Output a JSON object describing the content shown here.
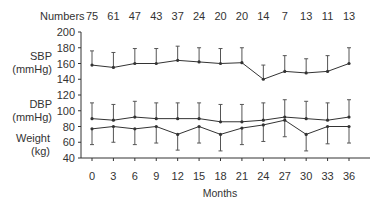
{
  "chart_data": {
    "type": "line",
    "title": "",
    "xlabel": "Months",
    "x": [
      0,
      3,
      6,
      9,
      12,
      15,
      18,
      21,
      24,
      27,
      30,
      33,
      36
    ],
    "numbers_label": "Numbers",
    "numbers": [
      75,
      61,
      47,
      43,
      37,
      24,
      20,
      20,
      14,
      7,
      13,
      11,
      13
    ],
    "ylim": [
      40,
      200
    ],
    "yticks": [
      40,
      60,
      80,
      100,
      120,
      140,
      160,
      180,
      200
    ],
    "grid": false,
    "legend": "none; series labelled on left side of y axis",
    "series": [
      {
        "name": "SBP (mmHg)",
        "label_lines": [
          "SBP",
          "(mmHg)"
        ],
        "values": [
          158,
          155,
          160,
          160,
          164,
          162,
          160,
          161,
          140,
          150,
          148,
          150,
          160
        ],
        "error_direction": "up",
        "error_ends": [
          176,
          174,
          179,
          179,
          182,
          180,
          179,
          180,
          158,
          170,
          166,
          170,
          180
        ]
      },
      {
        "name": "DBP (mmHg)",
        "label_lines": [
          "DBP",
          "(mmHg)"
        ],
        "values": [
          90,
          88,
          92,
          90,
          90,
          90,
          86,
          86,
          88,
          92,
          90,
          88,
          92
        ],
        "error_direction": "up",
        "error_ends": [
          110,
          108,
          112,
          110,
          110,
          110,
          108,
          108,
          110,
          114,
          112,
          110,
          114
        ]
      },
      {
        "name": "Weight (kg)",
        "label_lines": [
          "Weight",
          "(kg)"
        ],
        "values": [
          77,
          80,
          77,
          80,
          70,
          80,
          70,
          78,
          82,
          88,
          70,
          80,
          80
        ],
        "error_direction": "down",
        "error_ends": [
          57,
          60,
          57,
          59,
          50,
          59,
          49,
          57,
          61,
          67,
          49,
          58,
          59
        ]
      }
    ]
  }
}
